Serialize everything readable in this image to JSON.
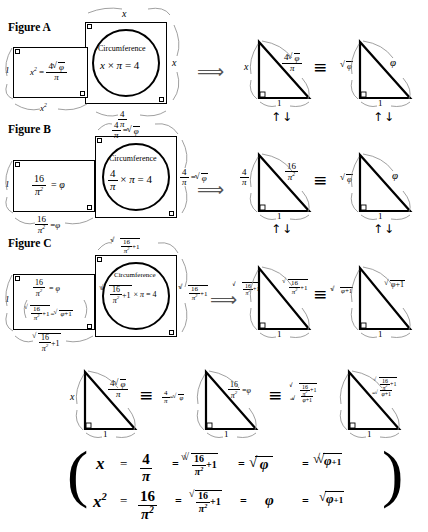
{
  "figures": [
    {
      "id": "A",
      "label": "Figure A",
      "rect_left_height_label": "1",
      "rect_left_inner": "x² = 4√φ / π",
      "rect_left_bottom": "x²",
      "square_top": "x",
      "square_right": "x",
      "circle_caption": "Circumference",
      "circle_equation": "x × π = 4",
      "square_bottom": "4 / π",
      "triangle1": {
        "vertical": "x",
        "hypotenuse": "4√φ / π",
        "base": "1"
      },
      "triangle2": {
        "vertical": "√φ",
        "hypotenuse": "φ",
        "base": "1"
      }
    },
    {
      "id": "B",
      "label": "Figure B",
      "rect_left_height_label": "1",
      "rect_left_inner": "16 / π² = φ",
      "rect_left_bottom": "16 / π² = φ",
      "square_top": "4 / π = √φ",
      "square_right": "4 / π = √φ",
      "circle_caption": "Circumference",
      "circle_equation": "4/π × π = 4",
      "triangle1": {
        "vertical": "4 / π",
        "hypotenuse": "16 / π²",
        "base": "1"
      },
      "triangle2": {
        "vertical": "√φ",
        "hypotenuse": "φ",
        "base": "1"
      }
    },
    {
      "id": "C",
      "label": "Figure C",
      "rect_left_height_label": "1",
      "rect_left_inner": "16 / π² = φ",
      "rect_left_inner2": "√(16/π² + 1) = √(φ + 1)",
      "rect_left_bottom": "√(16/π² + 1)",
      "square_top": "√√(16/π² + 1)",
      "square_right": "√√(16/π² + 1)",
      "circle_caption": "Circumference",
      "circle_equation": "√√(16/π²+1) × π = 4",
      "triangle1": {
        "vertical": "√√(16/π²+1)",
        "hypotenuse": "√(16/π²+1)",
        "base": "1"
      },
      "triangle2": {
        "vertical": "√√(φ+1)",
        "hypotenuse": "√(φ+1)",
        "base": "1"
      }
    }
  ],
  "connectors": {
    "implies": "⟹",
    "updown": "↑↓",
    "equivalent": "≡"
  },
  "summary_row": {
    "triangle1": {
      "vertical": "x",
      "hypotenuse": "4√φ / π",
      "base": "1"
    },
    "triangle2": {
      "vertical": "4/π = √φ",
      "hypotenuse": "16/π² = φ",
      "base": "1"
    },
    "triangle3": {
      "vertical": "√√(16/π²+1) = √√(φ+1)",
      "hypotenuse": "√(16/π²+1) = √(φ+1)",
      "base": "1"
    }
  },
  "final_equations": {
    "row1": {
      "lhs": "x",
      "t1": "4 / π",
      "t2": "√√(16/π²+1)",
      "t3": "√φ",
      "t4": "√√(φ+1)"
    },
    "row2": {
      "lhs": "x²",
      "t1": "16 / π²",
      "t2": "√(16/π²+1)",
      "t3": "φ",
      "t4": "√(φ+1)"
    },
    "equals": "="
  },
  "glyphs": {
    "pi": "π",
    "phi": "φ",
    "times": "×",
    "sqrt": "√",
    "four": "4",
    "sixteen": "16",
    "one": "1",
    "plus_one": "+1",
    "x": "x"
  },
  "colors": {
    "ink": "#000000",
    "arrow": "#555555",
    "paper": "#ffffff"
  }
}
